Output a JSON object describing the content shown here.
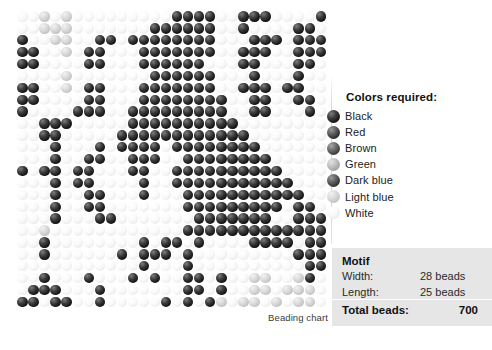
{
  "chart": {
    "caption": "Beading chart",
    "columns": 28,
    "rows": 25,
    "palette_keys": [
      "black",
      "red",
      "brown",
      "green",
      "darkblue",
      "lightblue",
      "white"
    ],
    "palette_hex": {
      "black": "#141414",
      "red": "#2c2c2c",
      "brown": "#3d3d3d",
      "green": "#a4a4a4",
      "darkblue": "#333333",
      "lightblue": "#c4c4c4",
      "white": "#ededed"
    },
    "grid": [
      "wwlwlwwwwwwwwwbbbbwwbbbwwwwb",
      "wwlllwwwwwwwbbbbbbwwbwwwwbbw",
      "bwwllwwbbwbbbbbbbbwwwbbbwbbb",
      "bbwwlwbbwwwbbbbbbbwwbbbwwbbb",
      "bbwwwwbbwwwbbbbbbwwwbbwwwbbw",
      "wwwwlwwwwwwwbbbbbbwwwbwwwbww",
      "bbwwlwbbwwwbbbbbbbwwbbbwbbww",
      "bbwwwwbbwwwbbbbbbbbwwbbwwbbw",
      "bwwwwbbbwwbbbbbbbbbwwbbwwwbw",
      "wwbbbwwwwwbbbbbbbbbbwwwwwwww",
      "wwbbwwwwwbbbbbbbbbbbbwwwwwww",
      "wwwbwwwbwbbbbwbbbbbbbbwwwwww",
      "wwwbwwbbwwbbbwwbbbbbbbbwwwww",
      "bwbbwbbwwwbbwwbbbbbbbbbbwwww",
      "wwwbwbbwwwwbwwbbbbbbbbbbbwww",
      "wwwbwwbbwwwbwwwbbbbbbbbbbbww",
      "wwwbwwbbwwwwwwwbbbbbbbbbwbbw",
      "wwwbwwwbbwwwwwwwbbbbbbbwwbbb",
      "wwlwwwwwwwwwwwwbbbbbbbbbbbbb",
      "wwbwwwwwwwwbwbbwbwwwwbbbbwbb",
      "wwbwwwwwwbwbbbwbwwwwwwwwwbbb",
      "wwwwwwwwwwwbwwwbwwwwwwwwwwbb",
      "wwbwwwbwwwbwbwwbbwbwwllwwlbw",
      "wbbbwwwbwwwwwwwbbwbwwllwlllw",
      "bbwbbwwbwwwwwbwbwblwllwlwllw"
    ]
  },
  "legend": {
    "title": "Colors required:",
    "items": [
      {
        "key": "black",
        "label": "Black"
      },
      {
        "key": "red",
        "label": "Red"
      },
      {
        "key": "brown",
        "label": "Brown"
      },
      {
        "key": "green",
        "label": "Green"
      },
      {
        "key": "darkblue",
        "label": "Dark blue"
      },
      {
        "key": "lightblue",
        "label": "Light blue"
      },
      {
        "key": "white",
        "label": "White"
      }
    ]
  },
  "motif": {
    "title": "Motif",
    "width_label": "Width:",
    "width_value": "28 beads",
    "length_label": "Length:",
    "length_value": "25 beads",
    "total_label": "Total beads:",
    "total_value": "700"
  }
}
